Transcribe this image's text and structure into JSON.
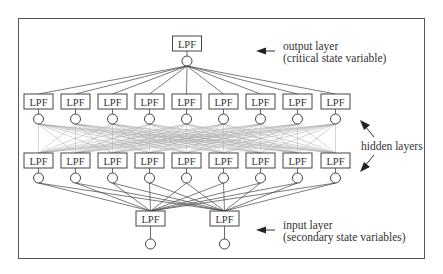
{
  "diagram": {
    "node_label": "LPF",
    "layers": [
      {
        "name": "output",
        "count": 1,
        "box_y": 36,
        "circle_y": 61,
        "centers": [
          187
        ]
      },
      {
        "name": "hidden1",
        "count": 9,
        "box_y": 94,
        "circle_y": 119,
        "centers": [
          38.5,
          75.5,
          112.5,
          149.5,
          186.5,
          223.5,
          260.5,
          297.5,
          335.5
        ]
      },
      {
        "name": "hidden2",
        "count": 9,
        "box_y": 153,
        "circle_y": 178,
        "centers": [
          38.5,
          75.5,
          112.5,
          149.5,
          186.5,
          223.5,
          260.5,
          297.5,
          335.5
        ]
      },
      {
        "name": "input",
        "count": 2,
        "box_y": 211,
        "circle_y": 244,
        "centers": [
          150.5,
          224.5
        ]
      }
    ],
    "annotations": {
      "output_line1": "output layer",
      "output_line2": "(critical state variable)",
      "hidden": "hidden layers",
      "input_line1": "input layer",
      "input_line2": "(secondary state variables)"
    },
    "colors": {
      "line": "#444444",
      "dense_line": "#aaaaaa",
      "frame": "#555555",
      "text": "#333333"
    }
  }
}
